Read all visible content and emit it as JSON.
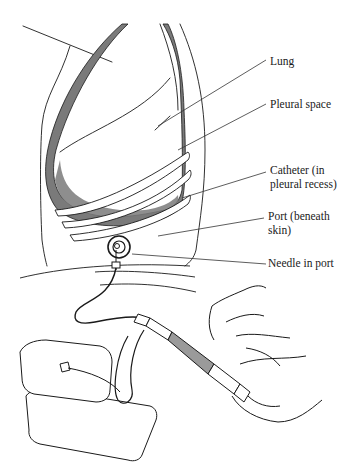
{
  "figure": {
    "colors": {
      "ink": "#1a1a1a",
      "pleural_fill": "#7a7a7a",
      "background": "#ffffff"
    }
  },
  "labels": [
    {
      "id": "lung",
      "text": "Lung"
    },
    {
      "id": "pleural-space",
      "text": "Pleural space"
    },
    {
      "id": "catheter-line1",
      "text": "Catheter (in"
    },
    {
      "id": "catheter-line2",
      "text": "pleural recess)"
    },
    {
      "id": "port-line1",
      "text": "Port (beneath"
    },
    {
      "id": "port-line2",
      "text": "skin)"
    },
    {
      "id": "needle",
      "text": "Needle in port"
    }
  ]
}
